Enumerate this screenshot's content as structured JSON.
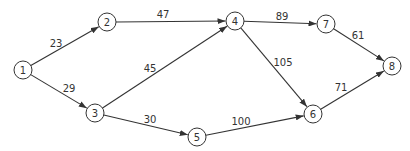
{
  "diagram": {
    "type": "directed-weighted-network",
    "node_radius": 9,
    "colors": {
      "stroke": "#333333",
      "node_fill": "#ffffff",
      "text": "#333333",
      "background": "#ffffff"
    },
    "nodes": [
      {
        "id": "1",
        "label": "1",
        "x": 23,
        "y": 70
      },
      {
        "id": "2",
        "label": "2",
        "x": 107,
        "y": 22
      },
      {
        "id": "3",
        "label": "3",
        "x": 95,
        "y": 113
      },
      {
        "id": "4",
        "label": "4",
        "x": 235,
        "y": 21
      },
      {
        "id": "5",
        "label": "5",
        "x": 197,
        "y": 137
      },
      {
        "id": "6",
        "label": "6",
        "x": 313,
        "y": 114
      },
      {
        "id": "7",
        "label": "7",
        "x": 326,
        "y": 24
      },
      {
        "id": "8",
        "label": "8",
        "x": 392,
        "y": 66
      }
    ],
    "edges": [
      {
        "from": "1",
        "to": "2",
        "weight": "23",
        "label_x": 56,
        "label_y": 43
      },
      {
        "from": "1",
        "to": "3",
        "weight": "29",
        "label_x": 69,
        "label_y": 88
      },
      {
        "from": "2",
        "to": "4",
        "weight": "47",
        "label_x": 163,
        "label_y": 14
      },
      {
        "from": "3",
        "to": "4",
        "weight": "45",
        "label_x": 150,
        "label_y": 68
      },
      {
        "from": "3",
        "to": "5",
        "weight": "30",
        "label_x": 150,
        "label_y": 119
      },
      {
        "from": "4",
        "to": "7",
        "weight": "89",
        "label_x": 282,
        "label_y": 16
      },
      {
        "from": "4",
        "to": "6",
        "weight": "105",
        "label_x": 283,
        "label_y": 62
      },
      {
        "from": "5",
        "to": "6",
        "weight": "100",
        "label_x": 241,
        "label_y": 121
      },
      {
        "from": "7",
        "to": "8",
        "weight": "61",
        "label_x": 358,
        "label_y": 35
      },
      {
        "from": "6",
        "to": "8",
        "weight": "71",
        "label_x": 341,
        "label_y": 87
      }
    ]
  }
}
